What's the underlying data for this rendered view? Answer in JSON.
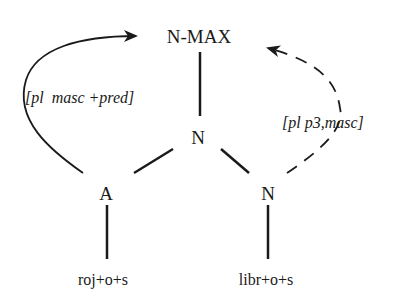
{
  "diagram": {
    "type": "syntactic-tree-agreement",
    "nodes": {
      "root": "N-MAX",
      "mid": "N",
      "left": "A",
      "right": "N",
      "leaf_left": "roj+o+s",
      "leaf_right": "libr+o+s"
    },
    "features": {
      "left_arc": "[pl  masc +pred]",
      "right_arc": "[pl p3,masc]"
    },
    "edges": [
      {
        "from": "N-MAX",
        "to": "N",
        "style": "solid"
      },
      {
        "from": "N",
        "to": "A",
        "style": "solid"
      },
      {
        "from": "N",
        "to": "N (right)",
        "style": "solid"
      },
      {
        "from": "A",
        "to": "roj+o+s",
        "style": "solid"
      },
      {
        "from": "N (right)",
        "to": "libr+o+s",
        "style": "solid"
      },
      {
        "from": "A",
        "to": "N-MAX",
        "style": "solid-arrow",
        "label": "[pl  masc +pred]"
      },
      {
        "from": "N (right)",
        "to": "N-MAX",
        "style": "dashed-arrow",
        "label": "[pl p3,masc]"
      }
    ],
    "colors": {
      "ink": "#1a1a1a",
      "background": "#ffffff"
    }
  }
}
